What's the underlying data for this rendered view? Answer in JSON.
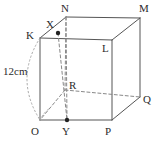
{
  "figure": {
    "kind": "cube-net-diagram",
    "stroke_color": "#555555",
    "dash_color": "#777777",
    "dot_color": "#222222",
    "background": "#ffffff",
    "width": 159,
    "height": 141
  },
  "measurements": [
    {
      "id": "edge-length",
      "text": "12cm",
      "x": 3,
      "y": 66
    }
  ],
  "vertices": [
    {
      "id": "K",
      "label": "K",
      "px": 40,
      "py": 38,
      "label_x": 26,
      "label_y": 30
    },
    {
      "id": "L",
      "label": "L",
      "px": 112,
      "py": 40,
      "label_x": 102,
      "label_y": 43
    },
    {
      "id": "O",
      "label": "O",
      "px": 40,
      "py": 120,
      "label_x": 31,
      "label_y": 126
    },
    {
      "id": "P",
      "label": "P",
      "px": 112,
      "py": 120,
      "label_x": 105,
      "label_y": 126
    },
    {
      "id": "N",
      "label": "N",
      "px": 66,
      "py": 17,
      "label_x": 61,
      "label_y": 3
    },
    {
      "id": "M",
      "label": "M",
      "px": 140,
      "py": 18,
      "label_x": 139,
      "label_y": 3
    },
    {
      "id": "Q",
      "label": "Q",
      "px": 140,
      "py": 97,
      "label_x": 143,
      "label_y": 94
    },
    {
      "id": "R",
      "label": "R",
      "px": 65,
      "py": 90,
      "label_x": 69,
      "label_y": 80
    }
  ],
  "points": [
    {
      "id": "X",
      "label": "X",
      "px": 58,
      "py": 33,
      "label_x": 46,
      "label_y": 19,
      "marked": true
    },
    {
      "id": "Y",
      "label": "Y",
      "px": 67,
      "py": 120,
      "label_x": 62,
      "label_y": 126,
      "marked": true
    }
  ],
  "solid_edges": [
    {
      "from": "K",
      "to": "L"
    },
    {
      "from": "K",
      "to": "O"
    },
    {
      "from": "L",
      "to": "P"
    },
    {
      "from": "O",
      "to": "P"
    },
    {
      "from": "K",
      "to": "N"
    },
    {
      "from": "L",
      "to": "M"
    },
    {
      "from": "P",
      "to": "Q"
    },
    {
      "from": "N",
      "to": "M"
    },
    {
      "from": "M",
      "to": "Q"
    }
  ],
  "dashed_edges": [
    {
      "from": "N",
      "to": "R"
    },
    {
      "from": "R",
      "to": "O"
    },
    {
      "from": "R",
      "to": "Q"
    },
    {
      "from": "X",
      "to": "Y"
    },
    {
      "from": "N",
      "to": "Y"
    }
  ],
  "dotted_arcs": [
    {
      "id": "arc-K-O",
      "from": "K",
      "to": "O",
      "bulge_x": 14,
      "bulge_y": 79
    },
    {
      "id": "arc-O-X",
      "from": "O",
      "to": "X",
      "note": "short dotted arc near O toward interior"
    }
  ]
}
